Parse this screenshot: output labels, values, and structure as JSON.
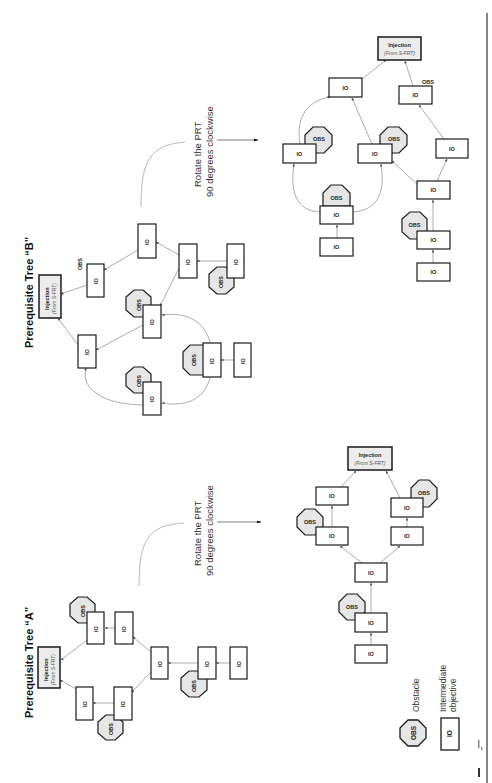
{
  "titles": {
    "tree_a": "Prerequisite Tree “A”",
    "tree_b": "Prerequisite Tree “B”"
  },
  "rotate_instruction": {
    "line1": "Rotate the PRT",
    "line2": "90 degrees clockwise"
  },
  "nodes": {
    "io_label": "IO",
    "obs_label": "OBS",
    "injection_title": "Injection",
    "injection_sub": "(From S-FRT)"
  },
  "legend": {
    "obstacle_symbol": "OBS",
    "obstacle_label": "Obstacle",
    "io_symbol": "IO",
    "io_label_line1": "Intermediate",
    "io_label_line2": "objective"
  },
  "colors": {
    "stroke": "#1a1a1a",
    "obstacle_fill": "#e6e6e6",
    "injection_fill": "#ececec",
    "edge": "#8a8a8a"
  }
}
